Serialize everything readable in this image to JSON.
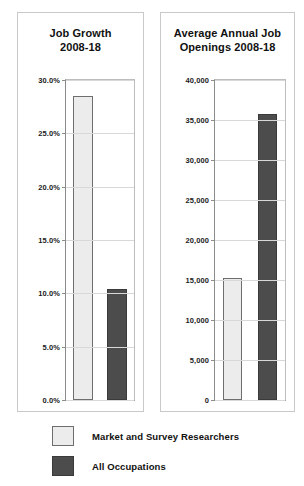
{
  "legend": {
    "items": [
      {
        "label": "Market and Survey Researchers",
        "swatch": "light",
        "color": "#ececec"
      },
      {
        "label": "All Occupations",
        "swatch": "dark",
        "color": "#4c4c4c"
      }
    ]
  },
  "chart_data": [
    {
      "type": "bar",
      "id": "job-growth",
      "title": "Job Growth 2008-18",
      "title_line1": "Job Growth",
      "title_line2": "2008-18",
      "xlabel": "",
      "ylabel": "",
      "ylim": [
        0,
        30
      ],
      "yticks": [
        0,
        5,
        10,
        15,
        20,
        25,
        30
      ],
      "ytick_labels": [
        "0.0%",
        "5.0%",
        "10.0%",
        "15.0%",
        "20.0%",
        "25.0%",
        "30.0%"
      ],
      "grid": true,
      "legend_position": "bottom",
      "categories": [
        "Market and Survey Researchers",
        "All Occupations"
      ],
      "values": [
        28.5,
        10.4
      ],
      "value_labels": [
        "28.5%",
        "10.4%"
      ],
      "colors": [
        "#ececec",
        "#4c4c4c"
      ]
    },
    {
      "type": "bar",
      "id": "annual-openings",
      "title": "Average Annual Job Openings 2008-18",
      "title_line1": "Average Annual Job",
      "title_line2": "Openings 2008-18",
      "xlabel": "",
      "ylabel": "",
      "ylim": [
        0,
        40000
      ],
      "yticks": [
        0,
        5000,
        10000,
        15000,
        20000,
        25000,
        30000,
        35000,
        40000
      ],
      "ytick_labels": [
        "0",
        "5,000",
        "10,000",
        "15,000",
        "20,000",
        "25,000",
        "30,000",
        "35,000",
        "40,000"
      ],
      "grid": true,
      "legend_position": "bottom",
      "categories": [
        "Market and Survey Researchers",
        "All Occupations"
      ],
      "values": [
        15200,
        35800
      ],
      "value_labels": [
        "15,200",
        "35,800"
      ],
      "colors": [
        "#ececec",
        "#4c4c4c"
      ]
    }
  ]
}
